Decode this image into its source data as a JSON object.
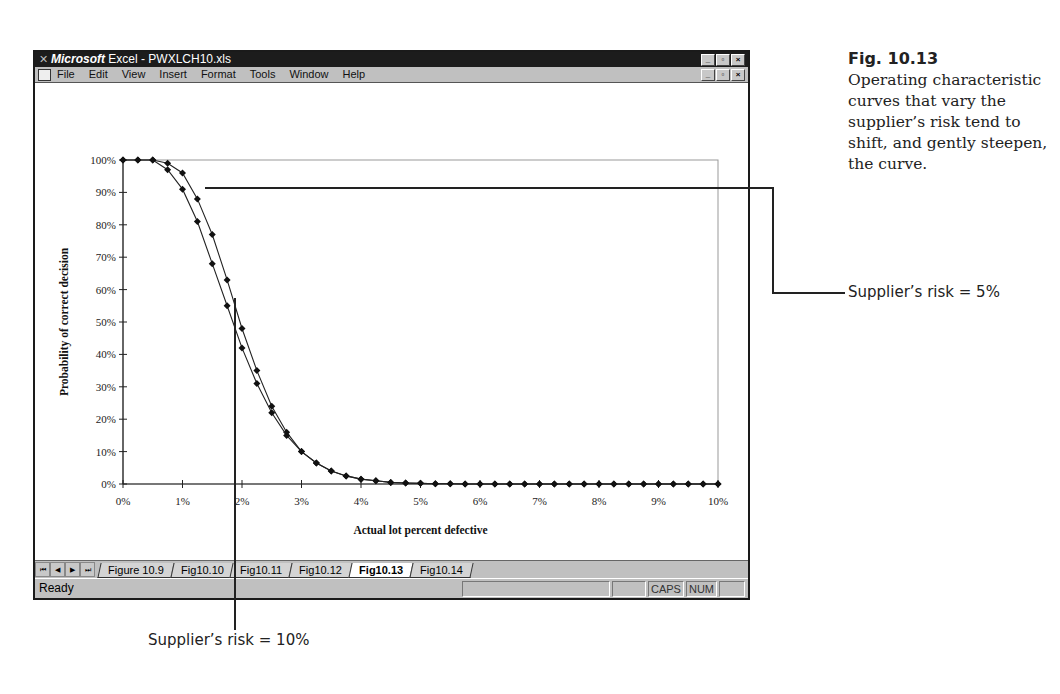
{
  "window": {
    "title_brand": "Microsoft",
    "title_rest": " Excel - PWXLCH10.xls",
    "window_buttons": [
      "minimize",
      "restore",
      "close"
    ],
    "menu": [
      {
        "label": "File",
        "accel": "F"
      },
      {
        "label": "Edit",
        "accel": "E"
      },
      {
        "label": "View",
        "accel": "V"
      },
      {
        "label": "Insert",
        "accel": "I"
      },
      {
        "label": "Format",
        "accel": "o"
      },
      {
        "label": "Tools",
        "accel": "T"
      },
      {
        "label": "Window",
        "accel": "W"
      },
      {
        "label": "Help",
        "accel": "H"
      }
    ]
  },
  "sheet_tabs": {
    "nav": [
      "first",
      "prev",
      "next",
      "last"
    ],
    "tabs": [
      {
        "label": "Figure 10.9",
        "active": false
      },
      {
        "label": "Fig10.10",
        "active": false
      },
      {
        "label": "Fig10.11",
        "active": false
      },
      {
        "label": "Fig10.12",
        "active": false
      },
      {
        "label": "Fig10.13",
        "active": true
      },
      {
        "label": "Fig10.14",
        "active": false
      }
    ]
  },
  "status": {
    "text": "Ready",
    "indicators": [
      "",
      "",
      "CAPS",
      "NUM",
      ""
    ]
  },
  "caption": {
    "figure": "Fig. 10.13",
    "text": "Operating characteristic curves that vary the supplier’s risk tend to shift, and gently steepen, the curve."
  },
  "callouts": {
    "risk5": "Supplier’s risk = 5%",
    "risk10": "Supplier’s risk = 10%"
  },
  "chart_data": {
    "type": "line",
    "title": "",
    "xlabel": "Actual lot percent defective",
    "ylabel": "Probability of correct decision",
    "x_ticks": [
      "0%",
      "1%",
      "2%",
      "3%",
      "4%",
      "5%",
      "6%",
      "7%",
      "8%",
      "9%",
      "10%"
    ],
    "y_ticks": [
      "0%",
      "10%",
      "20%",
      "30%",
      "40%",
      "50%",
      "60%",
      "70%",
      "80%",
      "90%",
      "100%"
    ],
    "xlim": [
      0,
      10
    ],
    "ylim": [
      0,
      100
    ],
    "grid": false,
    "legend": "none",
    "x": [
      0,
      0.25,
      0.5,
      0.75,
      1,
      1.25,
      1.5,
      1.75,
      2,
      2.25,
      2.5,
      2.75,
      3,
      3.25,
      3.5,
      3.75,
      4,
      4.25,
      4.5,
      4.75,
      5,
      5.25,
      5.5,
      5.75,
      6,
      6.25,
      6.5,
      6.75,
      7,
      7.25,
      7.5,
      7.75,
      8,
      8.25,
      8.5,
      8.75,
      9,
      9.25,
      9.5,
      9.75,
      10
    ],
    "series": [
      {
        "name": "Supplier’s risk = 5%",
        "values": [
          100,
          100,
          100,
          99,
          96,
          88,
          77,
          63,
          48,
          35,
          24,
          16,
          10,
          6.5,
          4,
          2.5,
          1.5,
          1,
          0.5,
          0.3,
          0.2,
          0.1,
          0.1,
          0,
          0,
          0,
          0,
          0,
          0,
          0,
          0,
          0,
          0,
          0,
          0,
          0,
          0,
          0,
          0,
          0,
          0
        ]
      },
      {
        "name": "Supplier’s risk = 10%",
        "values": [
          100,
          100,
          100,
          97,
          91,
          81,
          68,
          55,
          42,
          31,
          22,
          15,
          10,
          6.5,
          4,
          2.5,
          1.5,
          1,
          0.5,
          0.3,
          0.2,
          0.1,
          0.1,
          0,
          0,
          0,
          0,
          0,
          0,
          0,
          0,
          0,
          0,
          0,
          0,
          0,
          0,
          0,
          0,
          0,
          0
        ]
      }
    ]
  }
}
